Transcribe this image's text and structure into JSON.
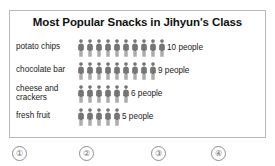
{
  "chart_data": {
    "type": "bar",
    "subtype": "pictograph",
    "title": "Most Popular Snacks in Jihyun's Class",
    "xlabel": "",
    "ylabel": "",
    "unit_label": "people",
    "icon": "person-icon",
    "icon_value": 1,
    "categories": [
      "potato chips",
      "chocolate bar",
      "cheese and\ncrackers",
      "fresh fruit"
    ],
    "values": [
      10,
      9,
      6,
      5
    ],
    "value_labels": [
      "10 people",
      "9 people",
      "6 people",
      "5 people"
    ],
    "rows": [
      {
        "label": "potato chips",
        "count": 10,
        "value_label": "10 people",
        "lines": 1
      },
      {
        "label": "chocolate bar",
        "count": 9,
        "value_label": "9 people",
        "lines": 1
      },
      {
        "label": "cheese and\ncrackers",
        "count": 6,
        "value_label": "6 people",
        "lines": 2
      },
      {
        "label": "fresh fruit",
        "count": 5,
        "value_label": "5 people",
        "lines": 1
      }
    ],
    "grid": false,
    "legend": "none",
    "colors": {
      "icon": "#757575",
      "frame_border": "#b9b9b9",
      "background": "#ffffff",
      "text": "#1a1a1a",
      "marker": "#6f6f6f"
    }
  },
  "markers": [
    {
      "label": "①",
      "x": 12
    },
    {
      "label": "②",
      "x": 79
    },
    {
      "label": "③",
      "x": 151
    },
    {
      "label": "④",
      "x": 211
    }
  ]
}
